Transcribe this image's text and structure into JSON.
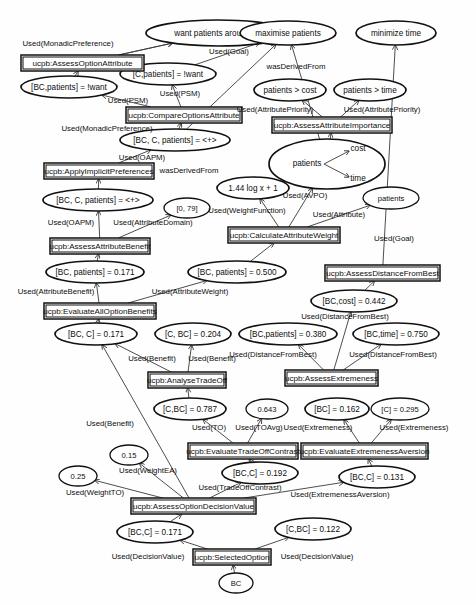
{
  "diagram": {
    "type": "provenance-graph",
    "width": 476,
    "height": 605,
    "colors": {
      "node_stroke": "#111111",
      "node_fill": "#ffffff",
      "edge_stroke": "#3a3a3a",
      "background": "#fefefe",
      "text": "#0d0d0d"
    }
  },
  "entities": [
    {
      "id": "e_want50",
      "label": "want patients around 50",
      "cx": 218,
      "cy": 33,
      "rx": 72,
      "ry": 13
    },
    {
      "id": "e_maxpat",
      "label": "maximise patients",
      "cx": 288,
      "cy": 33,
      "rx": 48,
      "ry": 12
    },
    {
      "id": "e_mintime",
      "label": "minimize time",
      "cx": 396,
      "cy": 33,
      "rx": 40,
      "ry": 12
    },
    {
      "id": "e_bcpat_want",
      "label": "[BC,patients] = !want",
      "cx": 69,
      "cy": 87,
      "rx": 48,
      "ry": 11
    },
    {
      "id": "e_cpat_want",
      "label": "[C,patients] = !want",
      "cx": 168,
      "cy": 74,
      "rx": 48,
      "ry": 11
    },
    {
      "id": "e_patcost",
      "label": "patients > cost",
      "cx": 290,
      "cy": 90,
      "rx": 36,
      "ry": 11
    },
    {
      "id": "e_pattime",
      "label": "patients > time",
      "cx": 370,
      "cy": 90,
      "rx": 36,
      "ry": 11
    },
    {
      "id": "e_bccpat1",
      "label": "[BC, C, patients] = <+>",
      "cx": 175,
      "cy": 140,
      "rx": 55,
      "ry": 11
    },
    {
      "id": "e_patcosttime",
      "label": "patients",
      "cx": 327,
      "cy": 164,
      "rx": 58,
      "ry": 25,
      "inner": {
        "cost_label": "cost",
        "time_label": "time"
      }
    },
    {
      "id": "e_logfn",
      "label": "1.44 log x + 1",
      "cx": 253,
      "cy": 188,
      "rx": 36,
      "ry": 11
    },
    {
      "id": "e_patients",
      "label": "patients",
      "cx": 391,
      "cy": 198,
      "rx": 28,
      "ry": 11
    },
    {
      "id": "e_bccpat2",
      "label": "[BC, C, patients] = <+>",
      "cx": 98,
      "cy": 200,
      "rx": 55,
      "ry": 11
    },
    {
      "id": "e_domain079",
      "label": "[0, 79]",
      "cx": 187,
      "cy": 208,
      "rx": 23,
      "ry": 10
    },
    {
      "id": "e_bcpat0171",
      "label": "[BC, patients] = 0.171",
      "cx": 95,
      "cy": 272,
      "rx": 49,
      "ry": 11
    },
    {
      "id": "e_bcpat0500",
      "label": "[BC, patients] = 0.500",
      "cx": 237,
      "cy": 272,
      "rx": 49,
      "ry": 11
    },
    {
      "id": "e_bccost0442",
      "label": "[BC,cost] = 0.442",
      "cx": 354,
      "cy": 301,
      "rx": 43,
      "ry": 11
    },
    {
      "id": "e_bcc0171a",
      "label": "[BC, C] = 0.171",
      "cx": 96,
      "cy": 334,
      "rx": 41,
      "ry": 11
    },
    {
      "id": "e_cbc0204",
      "label": "[C, BC] = 0.204",
      "cx": 193,
      "cy": 334,
      "rx": 38,
      "ry": 11
    },
    {
      "id": "e_bcpat0380",
      "label": "[BC,patients] = 0.380",
      "cx": 288,
      "cy": 334,
      "rx": 49,
      "ry": 11
    },
    {
      "id": "e_bctime0750",
      "label": "[BC,time] = 0.750",
      "cx": 396,
      "cy": 334,
      "rx": 43,
      "ry": 11
    },
    {
      "id": "e_cbc0787",
      "label": "[C,BC] = 0.787",
      "cx": 190,
      "cy": 409,
      "rx": 36,
      "ry": 11
    },
    {
      "id": "e_0643",
      "label": "0.643",
      "cx": 267,
      "cy": 409,
      "rx": 21,
      "ry": 10
    },
    {
      "id": "e_bc0162",
      "label": "[BC] = 0.162",
      "cx": 337,
      "cy": 409,
      "rx": 32,
      "ry": 11
    },
    {
      "id": "e_c0295",
      "label": "[C] = 0.295",
      "cx": 400,
      "cy": 409,
      "rx": 29,
      "ry": 11
    },
    {
      "id": "e_015",
      "label": "0.15",
      "cx": 129,
      "cy": 455,
      "rx": 19,
      "ry": 10
    },
    {
      "id": "e_025",
      "label": "0.25",
      "cx": 78,
      "cy": 476,
      "rx": 19,
      "ry": 10
    },
    {
      "id": "e_bcc0192",
      "label": "[BC,C] = 0.192",
      "cx": 260,
      "cy": 473,
      "rx": 38,
      "ry": 11
    },
    {
      "id": "e_bcc0131",
      "label": "[BC,C] = 0.131",
      "cx": 377,
      "cy": 477,
      "rx": 38,
      "ry": 11
    },
    {
      "id": "e_bcc0171b",
      "label": "[BC,C] = 0.171",
      "cx": 155,
      "cy": 532,
      "rx": 38,
      "ry": 11
    },
    {
      "id": "e_cbc0122",
      "label": "[C,BC] = 0.122",
      "cx": 313,
      "cy": 529,
      "rx": 38,
      "ry": 11
    },
    {
      "id": "e_bc",
      "label": "BC",
      "cx": 236,
      "cy": 583,
      "rx": 17,
      "ry": 10
    }
  ],
  "activities": [
    {
      "id": "a_assessoptattr",
      "label": "ucpb:AssessOptionAttribute",
      "x": 21,
      "y": 55,
      "w": 123,
      "h": 16
    },
    {
      "id": "a_compareoptattr",
      "label": "ucpb:CompareOptionsAttribute",
      "x": 126,
      "y": 107,
      "w": 116,
      "h": 16
    },
    {
      "id": "a_assessattrimp",
      "label": "ucpb:AssessAttributeImportance",
      "x": 272,
      "y": 117,
      "w": 120,
      "h": 16
    },
    {
      "id": "a_applyimplicit",
      "label": "ucpb:ApplyImplicitPreferences",
      "x": 44,
      "y": 163,
      "w": 110,
      "h": 16
    },
    {
      "id": "a_calcattrweight",
      "label": "ucpb:CalculateAttributeWeight",
      "x": 228,
      "y": 227,
      "w": 112,
      "h": 16
    },
    {
      "id": "a_assessattrben",
      "label": "ucpb:AssessAttributeBenefit",
      "x": 50,
      "y": 238,
      "w": 100,
      "h": 16
    },
    {
      "id": "a_assessdistbest",
      "label": "ucpb:AssessDistanceFromBest",
      "x": 325,
      "y": 265,
      "w": 115,
      "h": 16
    },
    {
      "id": "a_evalalloptben",
      "label": "ucpb:EvaluateAllOptionBenefits",
      "x": 44,
      "y": 303,
      "w": 112,
      "h": 16
    },
    {
      "id": "a_analysetradeoff",
      "label": "ucpb:AnalyseTradeOff",
      "x": 148,
      "y": 372,
      "w": 78,
      "h": 16
    },
    {
      "id": "a_assessextreme",
      "label": "ucpb:AssessExtremeness",
      "x": 285,
      "y": 370,
      "w": 93,
      "h": 16
    },
    {
      "id": "a_evaltradeoff",
      "label": "ucpb:EvaluateTradeOffContrast",
      "x": 188,
      "y": 443,
      "w": 110,
      "h": 16
    },
    {
      "id": "a_evalextremeav",
      "label": "ucpb:EvaluateExtremenessAversion",
      "x": 301,
      "y": 443,
      "w": 127,
      "h": 16
    },
    {
      "id": "a_assessoptdec",
      "label": "ucpb:AssessOptionDecisionValue",
      "x": 131,
      "y": 498,
      "w": 125,
      "h": 16
    },
    {
      "id": "a_selectedoption",
      "label": "ucpb:SelectedOption",
      "x": 193,
      "y": 549,
      "w": 78,
      "h": 16
    }
  ],
  "edges": [
    {
      "from": "a_assessoptattr",
      "to": "e_want50",
      "label": "Used(MonadicPreference)",
      "lx": 68,
      "ly": 44
    },
    {
      "from": "e_bcpat_want",
      "to": "a_assessoptattr",
      "label": "",
      "lx": 0,
      "ly": 0
    },
    {
      "from": "a_compareoptattr",
      "to": "e_cpat_want",
      "label": "Used(PSM)",
      "lx": 180,
      "ly": 94
    },
    {
      "from": "a_compareoptattr",
      "to": "e_bcpat_want",
      "label": "Used(PSM)",
      "lx": 128,
      "ly": 101
    },
    {
      "from": "e_bccpat1",
      "to": "a_compareoptattr",
      "label": "",
      "lx": 0,
      "ly": 0
    },
    {
      "from": "a_applyimplicit",
      "to": "e_bccpat1",
      "label": "Used(OAPM)",
      "lx": 142,
      "ly": 158
    },
    {
      "from": "e_bccpat1",
      "to": "e_maxpat",
      "label": "wasDerivedFrom",
      "lx": 189,
      "ly": 171
    },
    {
      "from": "e_bccpat2",
      "to": "a_applyimplicit",
      "label": "",
      "lx": 0,
      "ly": 0
    },
    {
      "from": "a_assessattrben",
      "to": "e_bccpat2",
      "label": "Used(OAPM)",
      "lx": 71,
      "ly": 223
    },
    {
      "from": "a_assessattrben",
      "to": "e_domain079",
      "label": "Used(AttributeDomain)",
      "lx": 153,
      "ly": 223
    },
    {
      "from": "e_bcpat0171",
      "to": "a_assessattrben",
      "label": "",
      "lx": 0,
      "ly": 0
    },
    {
      "from": "a_assessoptattr",
      "to": "e_want50",
      "label": "Used(MonadicPreference)",
      "lx": 107,
      "ly": 129
    },
    {
      "from": "e_cpat_want",
      "to": "e_maxpat",
      "label": "Used(Goal)",
      "lx": 229,
      "ly": 52
    },
    {
      "from": "e_patcosttime",
      "to": "e_maxpat",
      "label": "wasDerivedFrom",
      "lx": 296,
      "ly": 67
    },
    {
      "from": "a_assessattrimp",
      "to": "e_patcost",
      "label": "Used(AttributePriority)",
      "lx": 275,
      "ly": 110
    },
    {
      "from": "a_assessattrimp",
      "to": "e_pattime",
      "label": "Used(AttributePriority)",
      "lx": 382,
      "ly": 110
    },
    {
      "from": "e_patcosttime",
      "to": "a_assessattrimp",
      "label": "",
      "lx": 0,
      "ly": 0
    },
    {
      "from": "a_calcattrweight",
      "to": "e_patcosttime",
      "label": "Used(AVPO)",
      "lx": 305,
      "ly": 196
    },
    {
      "from": "a_calcattrweight",
      "to": "e_logfn",
      "label": "Used(WeightFunction)",
      "lx": 247,
      "ly": 211
    },
    {
      "from": "a_calcattrweight",
      "to": "e_patients",
      "label": "Used(Attribute)",
      "lx": 339,
      "ly": 215
    },
    {
      "from": "e_bcpat0500",
      "to": "a_calcattrweight",
      "label": "",
      "lx": 0,
      "ly": 0
    },
    {
      "from": "a_assessdistbest",
      "to": "e_mintime",
      "label": "Used(Goal)",
      "lx": 394,
      "ly": 239
    },
    {
      "from": "e_bccost0442",
      "to": "a_assessdistbest",
      "label": "",
      "lx": 0,
      "ly": 0
    },
    {
      "from": "a_evalalloptben",
      "to": "e_bcpat0171",
      "label": "Used(AttributeBenefit)",
      "lx": 56,
      "ly": 292
    },
    {
      "from": "a_evalalloptben",
      "to": "e_bcpat0500",
      "label": "Used(AttributeWeight)",
      "lx": 190,
      "ly": 292
    },
    {
      "from": "e_bcc0171a",
      "to": "a_evalalloptben",
      "label": "",
      "lx": 0,
      "ly": 0
    },
    {
      "from": "a_assessextreme",
      "to": "e_bccost0442",
      "label": "Used(DistanceFromBest)",
      "lx": 345,
      "ly": 317
    },
    {
      "from": "a_assessextreme",
      "to": "e_bcpat0380",
      "label": "Used(DistanceFromBest)",
      "lx": 273,
      "ly": 355
    },
    {
      "from": "a_assessextreme",
      "to": "e_bctime0750",
      "label": "Used(DistanceFromBest)",
      "lx": 393,
      "ly": 355
    },
    {
      "from": "a_analysetradeoff",
      "to": "e_bcc0171a",
      "label": "Used(Benefit)",
      "lx": 152,
      "ly": 359
    },
    {
      "from": "a_analysetradeoff",
      "to": "e_cbc0204",
      "label": "Used(Benefit)",
      "lx": 212,
      "ly": 359
    },
    {
      "from": "e_cbc0787",
      "to": "a_analysetradeoff",
      "label": "",
      "lx": 0,
      "ly": 0
    },
    {
      "from": "a_evaltradeoff",
      "to": "e_cbc0787",
      "label": "Used(TO)",
      "lx": 209,
      "ly": 428
    },
    {
      "from": "a_evaltradeoff",
      "to": "e_0643",
      "label": "Used(TOAvg)",
      "lx": 259,
      "ly": 428
    },
    {
      "from": "a_evalextremeav",
      "to": "e_bc0162",
      "label": "Used(Extremeness)",
      "lx": 318,
      "ly": 428
    },
    {
      "from": "a_evalextremeav",
      "to": "e_c0295",
      "label": "Used(Extremeness)",
      "lx": 414,
      "ly": 428
    },
    {
      "from": "e_bcc0192",
      "to": "a_evaltradeoff",
      "label": "",
      "lx": 0,
      "ly": 0
    },
    {
      "from": "e_bcc0131",
      "to": "a_evalextremeav",
      "label": "",
      "lx": 0,
      "ly": 0
    },
    {
      "from": "a_assessoptdec",
      "to": "e_015",
      "label": "Used(WeightEA)",
      "lx": 148,
      "ly": 471
    },
    {
      "from": "a_assessoptdec",
      "to": "e_025",
      "label": "Used(WeightTO)",
      "lx": 95,
      "ly": 493
    },
    {
      "from": "a_assessoptdec",
      "to": "e_bcc0192",
      "label": "Used(TradeOffContrast)",
      "lx": 240,
      "ly": 488
    },
    {
      "from": "a_assessoptdec",
      "to": "e_bcc0131",
      "label": "Used(ExtremenessAversion)",
      "lx": 340,
      "ly": 495
    },
    {
      "from": "a_assessoptdec",
      "to": "e_bcc0171a",
      "label": "Used(Benefit)",
      "lx": 110,
      "ly": 424
    },
    {
      "from": "e_bcc0171b",
      "to": "a_assessoptdec",
      "label": "",
      "lx": 0,
      "ly": 0
    },
    {
      "from": "a_selectedoption",
      "to": "e_bcc0171b",
      "label": "Used(DecisionValue)",
      "lx": 148,
      "ly": 557
    },
    {
      "from": "a_selectedoption",
      "to": "e_cbc0122",
      "label": "Used(DecisionValue)",
      "lx": 317,
      "ly": 557
    },
    {
      "from": "e_bc",
      "to": "a_selectedoption",
      "label": "",
      "lx": 0,
      "ly": 0
    }
  ],
  "edge_geometry": [
    {
      "name": "assessoptattr-to-want50",
      "d": "M 72,55 L 95,39"
    },
    {
      "name": "bcpatwant-to-assessoptattr",
      "d": "M 70,76 L 70,72"
    },
    {
      "name": "compareoptattr-to-cpatwant",
      "d": "M 172,107 L 172,86"
    },
    {
      "name": "compareoptattr-to-bcpatwant",
      "d": "M 138,107 L 116,92"
    },
    {
      "name": "bccpat1-to-compareoptattr",
      "d": "M 175,129 L 175,124"
    },
    {
      "name": "applyimplicit-to-bccpat1",
      "d": "M 120,163 L 156,151"
    },
    {
      "name": "bccpat1-to-maxpat",
      "d": "M 190,131 L 253,45"
    },
    {
      "name": "bccpat2-to-applyimplicit",
      "d": "M 98,189 L 98,180"
    },
    {
      "name": "assessattrben-to-bccpat2",
      "d": "M 98,238 L 98,212"
    },
    {
      "name": "assessattrben-to-domain079",
      "d": "M 143,238 L 180,219"
    },
    {
      "name": "bcpat0171-to-assessattrben",
      "d": "M 97,261 L 97,255"
    },
    {
      "name": "assessoptattr2-to-want50",
      "d": "M 105,158 L 160,48"
    },
    {
      "name": "cpatwant-to-maxpat",
      "d": "M 196,66 L 245,42"
    },
    {
      "name": "patcosttime-to-maxpat",
      "d": "M 303,141 L 285,46"
    },
    {
      "name": "assessattrimp-to-patcost",
      "d": "M 312,117 L 300,101"
    },
    {
      "name": "assessattrimp-to-pattime",
      "d": "M 348,117 L 360,101"
    },
    {
      "name": "patcosttime-to-assessattrimp",
      "d": "M 330,139 L 330,134"
    },
    {
      "name": "calcattrweight-to-patcosttime",
      "d": "M 290,227 L 310,188"
    },
    {
      "name": "calcattrweight-to-logfn",
      "d": "M 270,227 L 256,200"
    },
    {
      "name": "calcattrweight-to-patients",
      "d": "M 315,227 L 372,207"
    },
    {
      "name": "bcpat0500-to-calcattrweight",
      "d": "M 258,261 L 280,244"
    },
    {
      "name": "assessdistbest-to-mintime",
      "d": "M 400,265 L 400,46"
    },
    {
      "name": "bccost0442-to-assessdistbest",
      "d": "M 368,290 L 380,282"
    },
    {
      "name": "evalalloptben-to-bcpat0171",
      "d": "M 96,303 L 96,284"
    },
    {
      "name": "evalalloptben-to-bcpat0500",
      "d": "M 150,303 L 193,281"
    },
    {
      "name": "bcc0171a-to-evalalloptben",
      "d": "M 98,323 L 98,320"
    },
    {
      "name": "assessextreme-to-bccost0442",
      "d": "M 330,370 L 348,313"
    },
    {
      "name": "assessextreme-to-bcpat0380",
      "d": "M 322,370 L 293,346"
    },
    {
      "name": "assessextreme-to-bctime0750",
      "d": "M 338,370 L 382,346"
    },
    {
      "name": "analysetradeoff-to-bcc0171a",
      "d": "M 172,372 L 130,344"
    },
    {
      "name": "analysetradeoff-to-cbc0204",
      "d": "M 194,372 L 194,346"
    },
    {
      "name": "cbc0787-to-analysetradeoff",
      "d": "M 189,398 L 189,389"
    },
    {
      "name": "evaltradeoff-to-cbc0787",
      "d": "M 225,443 L 203,421"
    },
    {
      "name": "evaltradeoff-to-0643",
      "d": "M 252,443 L 264,420"
    },
    {
      "name": "evalextremeav-to-bc0162",
      "d": "M 345,443 L 338,421"
    },
    {
      "name": "evalextremeav-to-c0295",
      "d": "M 392,443 L 400,421"
    },
    {
      "name": "bcc0192-to-evaltradeoff",
      "d": "M 252,462 L 248,460"
    },
    {
      "name": "bcc0131-to-evalextremeav",
      "d": "M 365,466 L 365,460"
    },
    {
      "name": "assessoptdec-to-015",
      "d": "M 178,498 L 138,466"
    },
    {
      "name": "assessoptdec-to-025",
      "d": "M 170,505 L 97,479"
    },
    {
      "name": "assessoptdec-to-bcc0192",
      "d": "M 200,498 L 238,482"
    },
    {
      "name": "assessoptdec-to-bcc0131",
      "d": "M 256,505 L 340,484"
    },
    {
      "name": "assessoptdec-to-bcc0171a",
      "d": "M 182,498 L 104,346"
    },
    {
      "name": "bcc0171b-to-assessoptdec",
      "d": "M 170,521 L 186,515"
    },
    {
      "name": "selectedoption-to-bcc0171b",
      "d": "M 196,549 L 176,541"
    },
    {
      "name": "selectedoption-to-cbc0122",
      "d": "M 270,549 L 292,538"
    },
    {
      "name": "bc-to-selectedoption",
      "d": "M 234,573 L 232,566"
    }
  ]
}
